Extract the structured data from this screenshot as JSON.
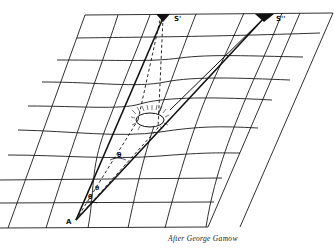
{
  "diagram": {
    "labels": {
      "star_true": "S'",
      "star_apparent": "S''",
      "observer": "A",
      "angle_1": "θ",
      "angle_2": "θ",
      "angle_3": "θ"
    },
    "caption": "After George Gamow"
  },
  "colors": {
    "ink": "#111111",
    "background": "#ffffff"
  }
}
